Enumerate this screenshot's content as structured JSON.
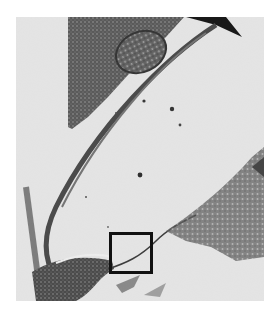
{
  "figure": {
    "type": "grayscale electron micrograph",
    "background_color": "#ffffff",
    "image_bounds": {
      "x": 16,
      "y": 17,
      "width": 248,
      "height": 284
    },
    "image_base_tone": "#e6e6e6",
    "annotations": [
      {
        "kind": "square-region-of-interest",
        "x": 109,
        "y": 232,
        "width": 44,
        "height": 42,
        "border_px": 3,
        "color": "#111111"
      },
      {
        "kind": "arrowhead-pointer",
        "position": "top-right",
        "color": "#000000"
      }
    ]
  }
}
